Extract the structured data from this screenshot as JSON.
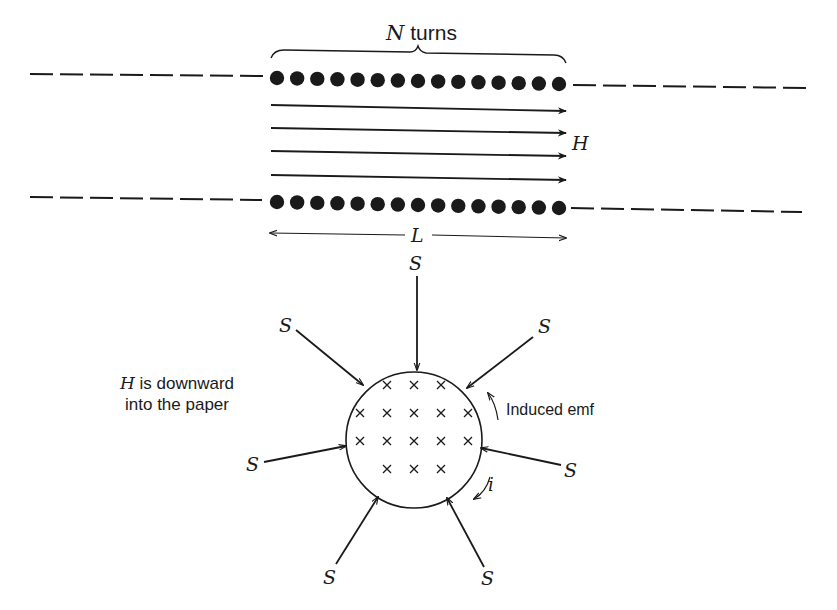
{
  "solenoid": {
    "turns_label_var": "N",
    "turns_label_text": " turns",
    "field_label": "H",
    "length_label": "L",
    "top_row_dot_count": 15,
    "bottom_row_dot_count": 15,
    "field_arrow_count": 4
  },
  "loop": {
    "note_line1_var": "H",
    "note_line1_text": " is downward",
    "note_line2": "into the paper",
    "emf_label": "Induced emf",
    "current_label": "i",
    "surface_label": "S",
    "cross_rows": [
      3,
      5,
      5,
      3
    ]
  },
  "colors": {
    "ink": "#1a1a1a",
    "background": "#ffffff"
  }
}
